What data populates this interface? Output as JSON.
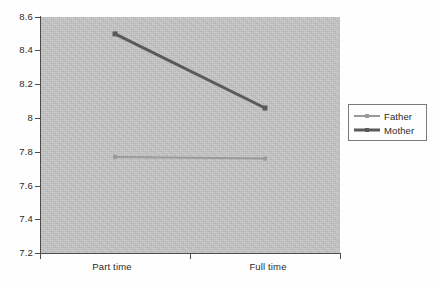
{
  "chart_data": {
    "type": "line",
    "title": "",
    "subtitle": "",
    "xlabel": "",
    "ylabel": "",
    "categories": [
      "Part time",
      "Full time"
    ],
    "ylim": [
      7.2,
      8.6
    ],
    "ytick_labels": [
      "8.6",
      "8.4",
      "8.2",
      "8",
      "7.8",
      "7.6",
      "7.4",
      "7.2"
    ],
    "ytick_values": [
      8.6,
      8.4,
      8.2,
      8.0,
      7.8,
      7.6,
      7.4,
      7.2
    ],
    "grid": false,
    "legend_position": "right",
    "plot_background_color": "#c5c5c5",
    "figure_background_color": "#fefefe",
    "axis_color": "#4d4d4d",
    "series": [
      {
        "name": "Father",
        "values": [
          7.77,
          7.76
        ],
        "color": "#9a9a9a",
        "line_width": 2,
        "marker": "square"
      },
      {
        "name": "Mother",
        "values": [
          8.5,
          8.06
        ],
        "color": "#5a5a5a",
        "line_width": 3,
        "marker": "square"
      }
    ]
  },
  "legend": {
    "entries": [
      {
        "label": "Father",
        "color": "#9a9a9a",
        "line_width": 2
      },
      {
        "label": "Mother",
        "color": "#5a5a5a",
        "line_width": 3
      }
    ]
  },
  "axes": {
    "y": {
      "ticks": [
        {
          "label": "8.6"
        },
        {
          "label": "8.4"
        },
        {
          "label": "8.2"
        },
        {
          "label": "8"
        },
        {
          "label": "7.8"
        },
        {
          "label": "7.6"
        },
        {
          "label": "7.4"
        },
        {
          "label": "7.2"
        }
      ]
    },
    "x": {
      "ticks": [
        {
          "label": "Part time"
        },
        {
          "label": "Full time"
        }
      ]
    }
  }
}
